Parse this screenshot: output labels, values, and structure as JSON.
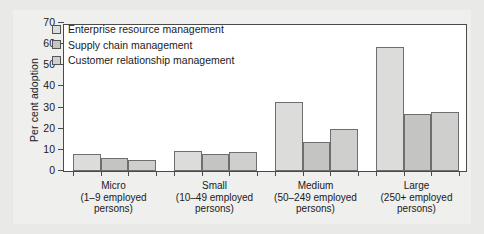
{
  "chart_data": {
    "type": "bar",
    "title": "",
    "xlabel": "",
    "ylabel": "Per cent adoption",
    "ylim": [
      0,
      70
    ],
    "yticks": [
      0,
      10,
      20,
      30,
      40,
      50,
      60,
      70
    ],
    "grid": false,
    "legend_position": "top-left inside",
    "categories": [
      "Micro",
      "Small",
      "Medium",
      "Large"
    ],
    "category_sublabels": [
      "(1–9 employed persons)",
      "(10–49 employed persons)",
      "(50–249 employed persons)",
      "(250+ employed persons)"
    ],
    "category_sublabel_lines": [
      [
        "(1–9 employed",
        "persons)"
      ],
      [
        "(10–49 employed",
        "persons)"
      ],
      [
        "(50–249 employed",
        "persons)"
      ],
      [
        "(250+ employed",
        "persons)"
      ]
    ],
    "series": [
      {
        "name": "Enterprise resource management",
        "color": "#dcdcda",
        "values": [
          8,
          9.5,
          32.5,
          58.5
        ]
      },
      {
        "name": "Supply chain management",
        "color": "#c4c4c2",
        "values": [
          6,
          8,
          13.5,
          27
        ]
      },
      {
        "name": "Customer relationship management",
        "color": "#cfcfcd",
        "values": [
          5,
          9,
          20,
          28
        ]
      }
    ]
  },
  "colors": {
    "page_background": "#e9e9e7",
    "panel_background": "#efefed",
    "plot_background": "#ffffff",
    "axis": "#4a4a4a",
    "bar_edge": "#6e6e6e",
    "text": "#1a1a1a"
  }
}
